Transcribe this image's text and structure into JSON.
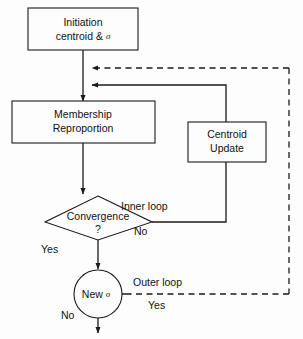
{
  "diagram": {
    "colors": {
      "background": "#fdfdfd",
      "stroke": "#1b1b1b",
      "text": "#111111"
    },
    "nodes": {
      "initiation": {
        "shape": "rectangle",
        "line1": "Initiation",
        "line2_text": "centroid &",
        "line2_symbol": "σ"
      },
      "membership": {
        "shape": "rectangle",
        "line1": "Membership",
        "line2": "Reproportion"
      },
      "centroid_update": {
        "shape": "rectangle",
        "line1": "Centroid",
        "line2": "Update"
      },
      "convergence": {
        "shape": "diamond",
        "line1": "Convergence",
        "line2": "?"
      },
      "new_sigma": {
        "shape": "circle",
        "text": "New",
        "symbol": "σ"
      }
    },
    "edges": {
      "inner_loop_label": "Inner loop",
      "inner_loop_branch": "No",
      "convergence_yes": "Yes",
      "outer_loop_label": "Outer loop",
      "outer_loop_branch": "Yes",
      "new_sigma_no": "No"
    }
  }
}
